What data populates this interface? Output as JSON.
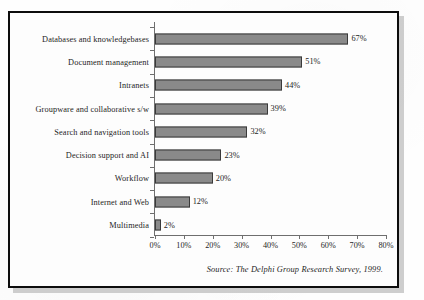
{
  "chart_data": {
    "type": "bar",
    "orientation": "horizontal",
    "title": "",
    "xlabel": "",
    "ylabel": "",
    "categories": [
      "Databases and knowledgebases",
      "Document management",
      "Intranets",
      "Groupware and collaborative s/w",
      "Search and navigation tools",
      "Decision support and AI",
      "Workflow",
      "Internet and Web",
      "Multimedia"
    ],
    "values": [
      67,
      51,
      44,
      39,
      32,
      23,
      20,
      12,
      2
    ],
    "value_labels": [
      "67%",
      "51%",
      "44%",
      "39%",
      "32%",
      "23%",
      "20%",
      "12%",
      "2%"
    ],
    "xlim": [
      0,
      80
    ],
    "xticks": [
      0,
      10,
      20,
      30,
      40,
      50,
      60,
      70,
      80
    ],
    "xtick_labels": [
      "0%",
      "10%",
      "20%",
      "30%",
      "40%",
      "50%",
      "60%",
      "70%",
      "80%"
    ],
    "grid": false,
    "legend": null,
    "bar_color": "#8a8a8a",
    "bar_edge_color": "#3a3a3a",
    "axis_color": "#6e6e6e",
    "text_color": "#1d1d1d"
  },
  "figure": {
    "source_note": "Source: The Delphi Group Research Survey, 1999.",
    "frame_color": "#0d0d0d",
    "background_color": "#fdfdfd",
    "shadow_color": "#bdbdbd"
  }
}
